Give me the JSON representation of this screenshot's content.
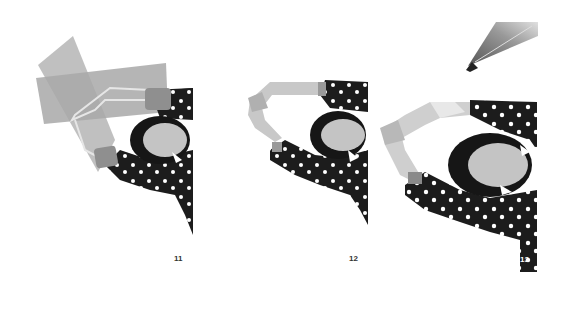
{
  "steps": [
    {
      "number": "11",
      "description": "arm with tape strips overlay"
    },
    {
      "number": "12",
      "description": "arms raised over head"
    },
    {
      "number": "13",
      "description": "arms raised with pencil"
    }
  ],
  "colors": {
    "dress": "#1c1c1c",
    "dots": "#ffffff",
    "skin": "#c4c4c4",
    "tape": "#a9a9a9",
    "hair": "#161616",
    "number": "#333333"
  }
}
